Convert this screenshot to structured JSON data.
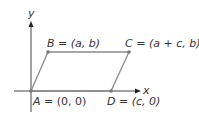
{
  "diagram": {
    "axes": {
      "x_label": "x",
      "y_label": "y"
    },
    "points": [
      {
        "id": "A",
        "label": "A = (0, 0)",
        "name": "A",
        "coords": "(0, 0)"
      },
      {
        "id": "B",
        "label": "B = (a, b)",
        "name": "B",
        "coords": "(a, b)"
      },
      {
        "id": "C",
        "label": "C = (a + c, b)",
        "name": "C",
        "coords": "(a + c, b)"
      },
      {
        "id": "D",
        "label": "D = (c, 0)",
        "name": "D",
        "coords": "(c, 0)"
      }
    ],
    "colors": {
      "axis": "#333333",
      "shape": "#888888",
      "point": "#777777",
      "text": "#333333"
    }
  }
}
